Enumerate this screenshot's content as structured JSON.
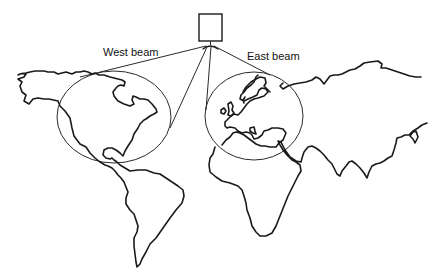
{
  "diagram": {
    "labels": {
      "west_beam": "West beam",
      "east_beam": "East beam"
    },
    "elements": [
      {
        "name": "satellite",
        "shape": "square"
      },
      {
        "name": "west-beam-coverage",
        "shape": "ellipse",
        "covers": "North America"
      },
      {
        "name": "east-beam-coverage",
        "shape": "ellipse",
        "covers": "Europe"
      }
    ],
    "colors": {
      "line": "#1a1a1a",
      "background": "#ffffff"
    }
  }
}
